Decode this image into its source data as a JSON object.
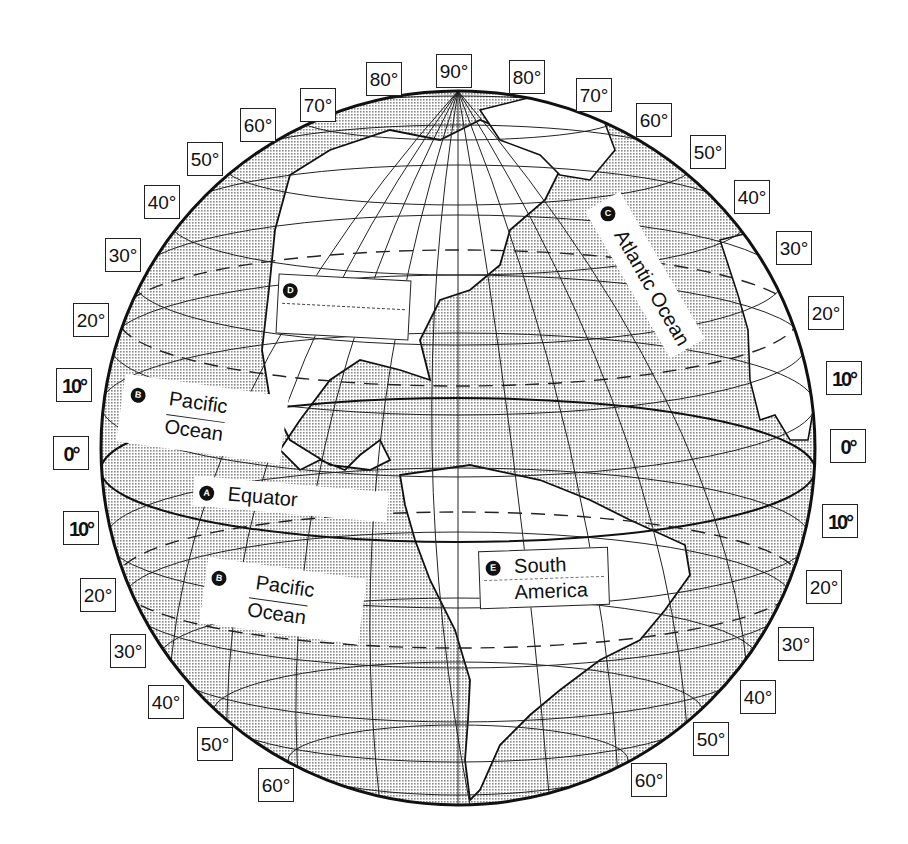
{
  "diagram": {
    "type": "globe-latitude-worksheet",
    "colors": {
      "ink": "#111111",
      "land": "#ffffff",
      "ocean_stipple": "#b8b8b8",
      "background": "#ffffff"
    },
    "latitude_labels_left": [
      {
        "id": "l70n",
        "text": "70°",
        "x": 300,
        "y": 88
      },
      {
        "id": "l60n",
        "text": "60°",
        "x": 240,
        "y": 108
      },
      {
        "id": "l50n",
        "text": "50°",
        "x": 187,
        "y": 142
      },
      {
        "id": "l40n",
        "text": "40°",
        "x": 144,
        "y": 185
      },
      {
        "id": "l30n",
        "text": "30°",
        "x": 105,
        "y": 238
      },
      {
        "id": "l20n",
        "text": "20°",
        "x": 73,
        "y": 303
      },
      {
        "id": "l10n",
        "text": "10°",
        "x": 56,
        "y": 368,
        "bold": true
      },
      {
        "id": "l0",
        "text": "0°",
        "x": 53,
        "y": 436,
        "bold": true
      },
      {
        "id": "l10s",
        "text": "10°",
        "x": 63,
        "y": 511,
        "bold": true
      },
      {
        "id": "l20s",
        "text": "20°",
        "x": 80,
        "y": 578
      },
      {
        "id": "l30s",
        "text": "30°",
        "x": 110,
        "y": 634
      },
      {
        "id": "l40s",
        "text": "40°",
        "x": 148,
        "y": 685
      },
      {
        "id": "l50s",
        "text": "50°",
        "x": 197,
        "y": 727
      },
      {
        "id": "l60s",
        "text": "60°",
        "x": 258,
        "y": 768
      }
    ],
    "latitude_labels_top": [
      {
        "id": "t80l",
        "text": "80°",
        "x": 366,
        "y": 62
      },
      {
        "id": "t90",
        "text": "90°",
        "x": 436,
        "y": 54
      },
      {
        "id": "t80r",
        "text": "80°",
        "x": 509,
        "y": 60
      }
    ],
    "latitude_labels_right": [
      {
        "id": "r70n",
        "text": "70°",
        "x": 576,
        "y": 78
      },
      {
        "id": "r60n",
        "text": "60°",
        "x": 636,
        "y": 103
      },
      {
        "id": "r50n",
        "text": "50°",
        "x": 690,
        "y": 135
      },
      {
        "id": "r40n",
        "text": "40°",
        "x": 734,
        "y": 180
      },
      {
        "id": "r30n",
        "text": "30°",
        "x": 776,
        "y": 231
      },
      {
        "id": "r20n",
        "text": "20°",
        "x": 808,
        "y": 296
      },
      {
        "id": "r10n",
        "text": "10°",
        "x": 826,
        "y": 361,
        "bold": true
      },
      {
        "id": "r0",
        "text": "0°",
        "x": 830,
        "y": 429,
        "bold": true
      },
      {
        "id": "r10s",
        "text": "10°",
        "x": 822,
        "y": 504,
        "bold": true
      },
      {
        "id": "r20s",
        "text": "20°",
        "x": 806,
        "y": 570
      },
      {
        "id": "r30s",
        "text": "30°",
        "x": 778,
        "y": 627
      },
      {
        "id": "r40s",
        "text": "40°",
        "x": 740,
        "y": 680
      },
      {
        "id": "r50s",
        "text": "50°",
        "x": 693,
        "y": 722
      },
      {
        "id": "r60s",
        "text": "60°",
        "x": 631,
        "y": 763
      }
    ],
    "callouts": [
      {
        "id": "A",
        "marker": "A",
        "text": "Equator",
        "x": 193,
        "y": 484,
        "w": 195,
        "h": 30,
        "rotate": 5
      },
      {
        "id": "B1",
        "marker": "B",
        "line1": "Pacific",
        "line2": "Ocean",
        "x": 120,
        "y": 385,
        "w": 165,
        "h": 68,
        "rotate": 8
      },
      {
        "id": "B2",
        "marker": "B",
        "line1": "Pacific",
        "line2": "Ocean",
        "x": 203,
        "y": 568,
        "w": 160,
        "h": 66,
        "rotate": 8
      },
      {
        "id": "C",
        "marker": "C",
        "text": "Atlantic Ocean",
        "x": 610,
        "y": 185,
        "w": 40,
        "h": 180,
        "rotate": -30
      },
      {
        "id": "D",
        "marker": "D",
        "line1": "",
        "line2": "",
        "x": 277,
        "y": 277,
        "w": 133,
        "h": 60,
        "rotate": 3
      },
      {
        "id": "E",
        "marker": "E",
        "line1": "South",
        "line2": "America",
        "x": 479,
        "y": 549,
        "w": 130,
        "h": 58,
        "rotate": -2
      }
    ]
  }
}
